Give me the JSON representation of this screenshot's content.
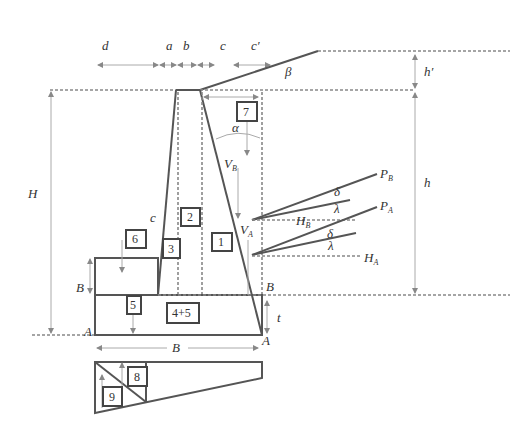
{
  "dimensions_top": {
    "d": "d",
    "a": "a",
    "b": "b",
    "c": "c",
    "c_prime": "c′"
  },
  "angles": {
    "beta": "β",
    "alpha": "α",
    "delta1": "δ",
    "lambda1": "λ",
    "delta2": "δ",
    "lambda2": "λ"
  },
  "heights": {
    "h_prime": "h′",
    "h": "h",
    "H": "H",
    "t": "t",
    "B_left": "B"
  },
  "forces": {
    "P_B": {
      "main": "P",
      "sub": "B"
    },
    "P_A": {
      "main": "P",
      "sub": "A"
    },
    "H_B": {
      "main": "H",
      "sub": "B"
    },
    "H_A": {
      "main": "H",
      "sub": "A"
    },
    "V_B": {
      "main": "V",
      "sub": "B"
    },
    "V_A": {
      "main": "V",
      "sub": "A"
    }
  },
  "points": {
    "A_left": "A",
    "A_right": "A",
    "B_right": "B",
    "c_face": "c"
  },
  "base_width": "B",
  "segments": [
    "1",
    "2",
    "3",
    "4+5",
    "5",
    "6",
    "7",
    "8",
    "9"
  ],
  "colors": {
    "line": "#555555",
    "dim": "#aaaaaa",
    "dash": "#888888",
    "background": "#ffffff"
  }
}
